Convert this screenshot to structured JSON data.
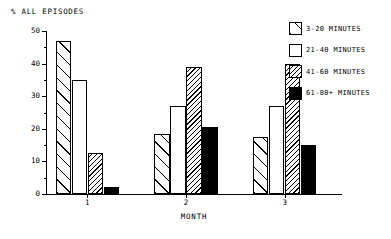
{
  "chart_data": {
    "type": "bar",
    "title": "",
    "ylabel": "% ALL EPISODES",
    "xlabel": "MONTH",
    "categories": [
      "1",
      "2",
      "3"
    ],
    "ylim": [
      0,
      50
    ],
    "ytick_labels": [
      "0",
      "10",
      "20",
      "30",
      "40",
      "50"
    ],
    "ytick_values": [
      0,
      10,
      20,
      30,
      40,
      50
    ],
    "yminor_values": [
      5,
      15,
      25,
      35,
      45
    ],
    "grid": false,
    "legend_position": "top-right",
    "series": [
      {
        "name": "3-20 MINUTES",
        "pattern": "sparse-forward-hatch",
        "values": [
          47,
          18.5,
          17.5
        ]
      },
      {
        "name": "21-40 MINUTES",
        "pattern": "white-open",
        "values": [
          35,
          27,
          27
        ]
      },
      {
        "name": "41-60 MINUTES",
        "pattern": "dense-back-hatch",
        "values": [
          12.5,
          39,
          40
        ]
      },
      {
        "name": "61-80+ MINUTES",
        "pattern": "solid-black",
        "values": [
          2,
          20.5,
          15
        ]
      }
    ]
  },
  "colors": {
    "ink": "#000000",
    "paper": "#ffffff"
  }
}
